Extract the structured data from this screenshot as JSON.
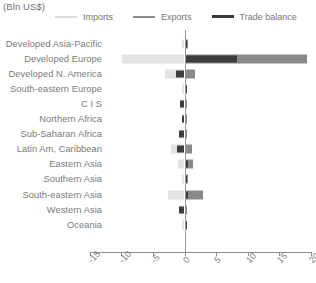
{
  "chart_data": {
    "type": "bar",
    "orientation": "horizontal",
    "title": "(Bln US$)",
    "xlabel": "",
    "ylabel": "",
    "xlim": [
      -15,
      20
    ],
    "xticks": [
      -15,
      -10,
      -5,
      0,
      5,
      10,
      15,
      20
    ],
    "xtick_labels": [
      "-15",
      "-10",
      "-5",
      "0",
      "5",
      "10",
      "15",
      "20"
    ],
    "grid": false,
    "legend_position": "top",
    "categories": [
      "Developed Asia-Pacific",
      "Developed Europe",
      "Developed N. America",
      "South-eastern Europe",
      "C I S",
      "Northern Africa",
      "Sub-Saharan Africa",
      "Latin Am, Caribbean",
      "Eastern Asia",
      "Southern Asia",
      "South-eastern Asia",
      "Western Asia",
      "Oceania"
    ],
    "series": [
      {
        "name": "Imports",
        "color": "#e3e3e3",
        "values": [
          -0.4,
          -9.8,
          -3.1,
          -0.3,
          -0.5,
          -0.3,
          -0.5,
          -2.2,
          -1.0,
          -0.4,
          -2.6,
          -0.6,
          -0.1
        ]
      },
      {
        "name": "Exports",
        "color": "#8a8a8a",
        "values": [
          0.5,
          19.4,
          1.7,
          0.4,
          0.3,
          0.2,
          0.4,
          1.2,
          1.3,
          0.6,
          3.0,
          0.3,
          0.1
        ]
      },
      {
        "name": "Trade balance",
        "color": "#3d3d3d",
        "values": [
          0.3,
          8.3,
          -1.3,
          0.2,
          -0.7,
          -0.2,
          -0.9,
          -1.2,
          0.5,
          0.4,
          0.5,
          -0.8,
          0.0
        ]
      }
    ]
  },
  "legend": {
    "items": [
      {
        "label": "Imports",
        "color": "#dcdcdc"
      },
      {
        "label": "Exports",
        "color": "#8a8a8a"
      },
      {
        "label": "Trade balance",
        "color": "#3a3a3a"
      }
    ]
  }
}
